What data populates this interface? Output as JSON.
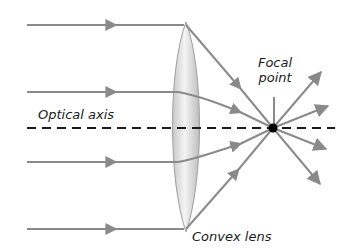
{
  "diagram": {
    "type": "convex-lens-ray-diagram",
    "labels": {
      "optical_axis": "Optical axis",
      "focal_line1": "Focal",
      "focal_line2": "point",
      "lens": "Convex lens"
    },
    "colors": {
      "ray": "#8a8a8a",
      "axis": "#1a1a1a",
      "lens_fill": "#e6e6e6",
      "lens_edge": "#a0a0a0",
      "focal_point": "#000000",
      "text": "#1a1a1a"
    },
    "focal_point": {
      "x": 273,
      "y": 128
    },
    "rays_in_y": [
      25,
      92,
      162,
      229
    ]
  }
}
